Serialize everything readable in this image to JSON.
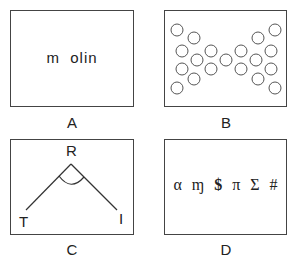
{
  "panels": {
    "A": {
      "label": "A",
      "text": "m  olin"
    },
    "B": {
      "label": "B",
      "description": "Circles arranged in a bow-tie / hourglass pattern",
      "circle_count": 21
    },
    "C": {
      "label": "C",
      "vertices": {
        "apex": "R",
        "left": "T",
        "right": "I"
      },
      "description": "Angle TRI with arc marking the angle at R"
    },
    "D": {
      "label": "D",
      "symbols": [
        "α",
        "ɱ",
        "$",
        "π",
        "Σ",
        "#"
      ]
    }
  }
}
